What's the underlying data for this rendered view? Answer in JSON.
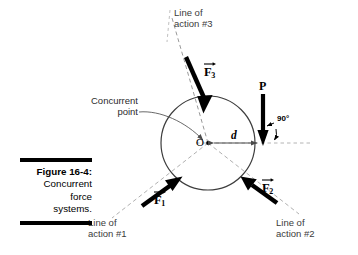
{
  "figure": {
    "caption_title": "Figure 16-4:",
    "caption_lines": [
      "Concurrent",
      "force",
      "systems."
    ]
  },
  "diagram": {
    "title_annotations": {
      "line_of_action_3": "Line of\naction #3",
      "line_of_action_1": "Line of\naction #1",
      "line_of_action_2": "Line of\naction #2",
      "concurrent_point": "Concurrent\npoint"
    },
    "point_label": "O",
    "distance_label": "d",
    "angle_label": "90°",
    "forces": [
      {
        "name": "F1",
        "symbol": "F",
        "subscript": "1",
        "direction": "up-right",
        "style": "vector"
      },
      {
        "name": "F2",
        "symbol": "F",
        "subscript": "2",
        "direction": "up-left",
        "style": "vector"
      },
      {
        "name": "F3",
        "symbol": "F",
        "subscript": "3",
        "direction": "down-right",
        "style": "vector"
      },
      {
        "name": "P",
        "symbol": "P",
        "subscript": "",
        "direction": "down",
        "style": "plain"
      }
    ],
    "geometry": {
      "circle_center": [
        208,
        143
      ],
      "circle_radius": 47,
      "d_start": [
        208,
        143
      ],
      "d_end": [
        263,
        143
      ]
    },
    "colors": {
      "ink": "#000000",
      "circle_stroke": "#3d3d3d",
      "dashed_stroke": "#8c8c8c",
      "dim_stroke": "#4a4a4a",
      "background": "#ffffff"
    }
  }
}
